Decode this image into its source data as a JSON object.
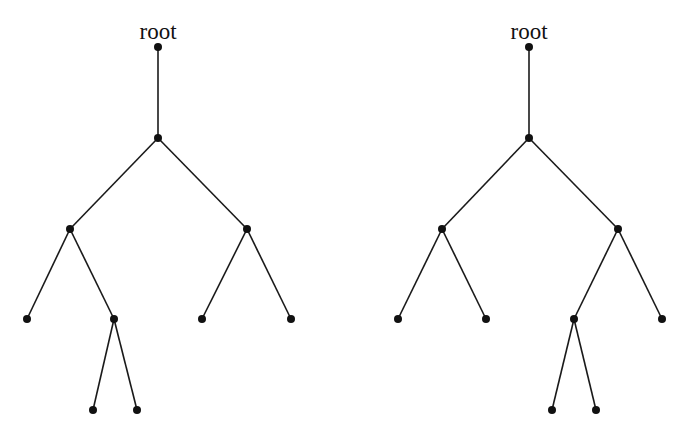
{
  "colors": {
    "background": "#ffffff",
    "ink": "#111111"
  },
  "trees": [
    {
      "id": "left-tree",
      "root_label": "root",
      "label_pos": [
        158,
        39
      ],
      "nodes": [
        {
          "id": "r",
          "x": 158,
          "y": 47
        },
        {
          "id": "a",
          "x": 158,
          "y": 138
        },
        {
          "id": "b",
          "x": 70,
          "y": 229
        },
        {
          "id": "c",
          "x": 247,
          "y": 229
        },
        {
          "id": "d",
          "x": 27,
          "y": 319
        },
        {
          "id": "e",
          "x": 114,
          "y": 319
        },
        {
          "id": "f",
          "x": 202,
          "y": 319
        },
        {
          "id": "g",
          "x": 291,
          "y": 319
        },
        {
          "id": "h",
          "x": 93,
          "y": 410
        },
        {
          "id": "i",
          "x": 137,
          "y": 410
        }
      ],
      "edges": [
        [
          "r",
          "a"
        ],
        [
          "a",
          "b"
        ],
        [
          "a",
          "c"
        ],
        [
          "b",
          "d"
        ],
        [
          "b",
          "e"
        ],
        [
          "c",
          "f"
        ],
        [
          "c",
          "g"
        ],
        [
          "e",
          "h"
        ],
        [
          "e",
          "i"
        ]
      ]
    },
    {
      "id": "right-tree",
      "root_label": "root",
      "label_pos": [
        529,
        39
      ],
      "nodes": [
        {
          "id": "r",
          "x": 529,
          "y": 47
        },
        {
          "id": "a",
          "x": 529,
          "y": 138
        },
        {
          "id": "b",
          "x": 442,
          "y": 229
        },
        {
          "id": "c",
          "x": 618,
          "y": 229
        },
        {
          "id": "d",
          "x": 398,
          "y": 319
        },
        {
          "id": "e",
          "x": 486,
          "y": 319
        },
        {
          "id": "f",
          "x": 574,
          "y": 319
        },
        {
          "id": "g",
          "x": 662,
          "y": 319
        },
        {
          "id": "h",
          "x": 552,
          "y": 410
        },
        {
          "id": "i",
          "x": 596,
          "y": 410
        }
      ],
      "edges": [
        [
          "r",
          "a"
        ],
        [
          "a",
          "b"
        ],
        [
          "a",
          "c"
        ],
        [
          "b",
          "d"
        ],
        [
          "b",
          "e"
        ],
        [
          "c",
          "f"
        ],
        [
          "c",
          "g"
        ],
        [
          "f",
          "h"
        ],
        [
          "f",
          "i"
        ]
      ]
    }
  ]
}
